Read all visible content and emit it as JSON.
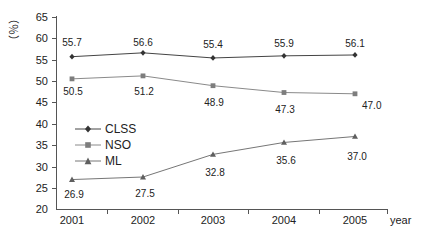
{
  "chart_data": {
    "type": "line",
    "title": "",
    "xlabel": "year",
    "ylabel": "(%)",
    "categories": [
      "2001",
      "2002",
      "2003",
      "2004",
      "2005"
    ],
    "ylim": [
      20,
      65
    ],
    "yticks": [
      20,
      25,
      30,
      35,
      40,
      45,
      50,
      55,
      60,
      65
    ],
    "grid": false,
    "legend_position": "inside-left-middle",
    "series": [
      {
        "name": "CLSS",
        "marker": "diamond",
        "color": "#444444",
        "values": [
          55.7,
          56.6,
          55.4,
          55.9,
          56.1
        ],
        "labels": [
          "55.7",
          "56.6",
          "55.4",
          "55.9",
          "56.1"
        ],
        "label_position": "above"
      },
      {
        "name": "NSO",
        "marker": "square",
        "color": "#8a8a8a",
        "values": [
          50.5,
          51.2,
          48.9,
          47.3,
          47.0
        ],
        "labels": [
          "50.5",
          "51.2",
          "48.9",
          "47.3",
          "47.0"
        ],
        "label_position": "below"
      },
      {
        "name": "ML",
        "marker": "triangle",
        "color": "#767676",
        "values": [
          26.9,
          27.5,
          32.8,
          35.6,
          37.0
        ],
        "labels": [
          "26.9",
          "27.5",
          "32.8",
          "35.6",
          "37.0"
        ],
        "label_position": "below"
      }
    ]
  },
  "axes": {
    "y_tick_labels": [
      "65",
      "60",
      "55",
      "50",
      "45",
      "40",
      "35",
      "30",
      "25",
      "20"
    ],
    "x_tick_labels": [
      "2001",
      "2002",
      "2003",
      "2004",
      "2005"
    ],
    "y_title": "（％）",
    "x_title": "year"
  },
  "legend": {
    "items": [
      {
        "label": "CLSS"
      },
      {
        "label": "NSO"
      },
      {
        "label": "ML"
      }
    ]
  }
}
